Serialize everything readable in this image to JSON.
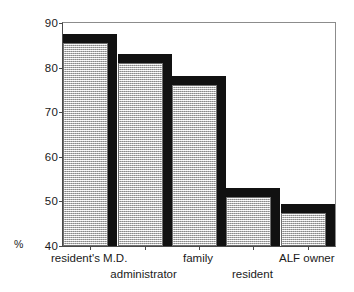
{
  "chart_data": {
    "type": "bar",
    "title": "",
    "subtitle": "",
    "xlabel": "",
    "ylabel": "%",
    "ylim": [
      40,
      90
    ],
    "ytick_step": 10,
    "yticks": [
      40,
      50,
      60,
      70,
      80,
      90
    ],
    "ytick_labels": [
      "40",
      "50",
      "60",
      "70",
      "80",
      "90"
    ],
    "grid": false,
    "legend": null,
    "legend_position": "none",
    "style": "3d-shaded-bars",
    "categories": [
      "resident's M.D.",
      "administrator",
      "family",
      "resident",
      "ALF owner"
    ],
    "category_label_rows": [
      0,
      1,
      0,
      1,
      0
    ],
    "values": [
      85.5,
      81,
      76,
      51,
      47.5
    ],
    "series": [
      {
        "name": "",
        "values": [
          85.5,
          81,
          76,
          51,
          47.5
        ]
      }
    ],
    "annotations": []
  },
  "colors": {
    "bar_fill": "#cdcdcd",
    "bar_shadow": "#111111",
    "bar_outline": "#6e6e6e",
    "axis": "#4a4a4a",
    "frame": "#8c8c8c",
    "text": "#1a1a1a",
    "background": "#ffffff"
  }
}
